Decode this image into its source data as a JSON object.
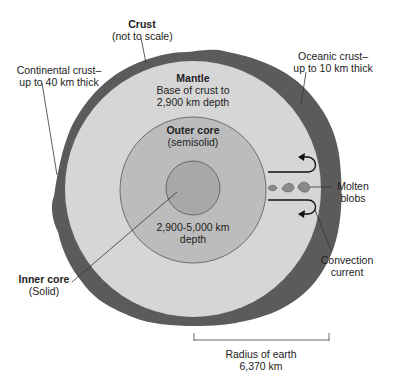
{
  "diagram": {
    "colors": {
      "crust": "#5b5b5b",
      "mantle": "#d6d6d6",
      "outer_core": "#bcbcbc",
      "inner_core": "#a8a8a8",
      "leader_line": "#333333"
    },
    "labels": {
      "crust": {
        "title": "Crust",
        "note": "(not to scale)"
      },
      "continental_crust": {
        "line1": "Continental crust–",
        "line2": "up to 40 km thick"
      },
      "oceanic_crust": {
        "line1": "Oceanic crust–",
        "line2": "up to 10 km thick"
      },
      "mantle": {
        "title": "Mantle",
        "line1": "Base of crust to",
        "line2": "2,900 km depth"
      },
      "outer_core": {
        "title": "Outer core",
        "note": "(semisolid)"
      },
      "core_depth": {
        "line1": "2,900-5,000 km",
        "line2": "depth"
      },
      "inner_core": {
        "title": "Inner core",
        "note": "(Solid)"
      },
      "molten_blobs": {
        "line1": "Molten",
        "line2": "blobs"
      },
      "convection_current": {
        "line1": "Convection",
        "line2": "current"
      },
      "radius": {
        "line1": "Radius of earth",
        "line2": "6,370 km"
      }
    }
  }
}
